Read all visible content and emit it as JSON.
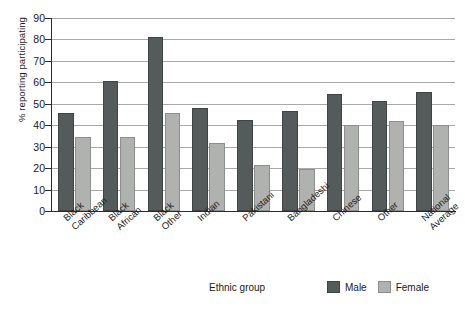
{
  "chart_data": {
    "type": "bar",
    "title": "",
    "xlabel": "Ethnic group",
    "ylabel": "% reporting participating",
    "ylim": [
      0,
      90
    ],
    "ytick_step": 10,
    "yticks": [
      90,
      80,
      70,
      60,
      50,
      40,
      30,
      20,
      10,
      0
    ],
    "grid": true,
    "legend_position": "bottom-right",
    "categories": [
      "Black\nCaribbean",
      "Black\nAfrican",
      "Black\nOther",
      "Indian",
      "Pakistani",
      "Bangladeshi",
      "Chinese",
      "Other",
      "National\nAverage"
    ],
    "series": [
      {
        "name": "Male",
        "color": "#555b5b",
        "values": [
          45.5,
          60.5,
          81,
          48,
          42.5,
          46.5,
          54.5,
          51.5,
          55.5
        ]
      },
      {
        "name": "Female",
        "color": "#b0b2b0",
        "values": [
          34.5,
          34.5,
          45.5,
          31.5,
          21.5,
          19.5,
          40,
          42,
          40
        ]
      }
    ]
  },
  "legend": {
    "entries": [
      {
        "label": "Male"
      },
      {
        "label": "Female"
      }
    ]
  }
}
